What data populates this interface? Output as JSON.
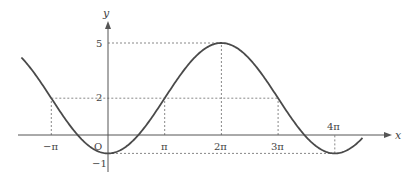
{
  "figure": {
    "function": "y = 2 - 3cos(x/2)",
    "axes": {
      "x_label": "x",
      "y_label": "y",
      "origin_label": "O"
    },
    "x_ticks": [
      {
        "value": -3.14159,
        "label": "−π"
      },
      {
        "value": 3.14159,
        "label": "π"
      },
      {
        "value": 6.28319,
        "label": "2π"
      },
      {
        "value": 9.42478,
        "label": "3π"
      },
      {
        "value": 12.56637,
        "label": "4π"
      }
    ],
    "y_ticks": [
      {
        "value": 5,
        "label": "5"
      },
      {
        "value": 2,
        "label": "2"
      },
      {
        "value": -1,
        "label": "−1"
      }
    ],
    "reference_lines": [
      {
        "type": "horizontal",
        "y": 5,
        "x_from": 0,
        "x_to": 6.28319
      },
      {
        "type": "horizontal",
        "y": 2,
        "x_from": -3.14159,
        "x_to": 9.42478
      },
      {
        "type": "horizontal",
        "y": -1,
        "x_from": 0,
        "x_to": 12.56637
      },
      {
        "type": "vertical",
        "x": -3.14159,
        "y_from": 0,
        "y_to": 2
      },
      {
        "type": "vertical",
        "x": 3.14159,
        "y_from": 0,
        "y_to": 2
      },
      {
        "type": "vertical",
        "x": 6.28319,
        "y_from": 0,
        "y_to": 5
      },
      {
        "type": "vertical",
        "x": 9.42478,
        "y_from": 0,
        "y_to": 2
      },
      {
        "type": "vertical",
        "x": 12.56637,
        "y_from": -1,
        "y_to": 0
      }
    ],
    "curve_domain": [
      -4.8,
      14.1
    ],
    "colors": {
      "curve": "#4a4a4a",
      "axis": "#555555",
      "dotted": "#888888"
    }
  }
}
